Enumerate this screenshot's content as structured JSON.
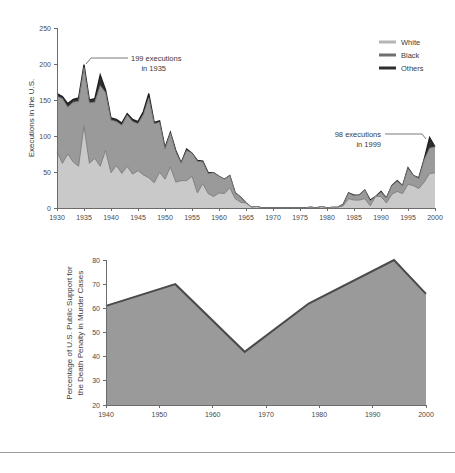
{
  "page": {
    "background": "#ffffff",
    "divider_color": "#9c9c9c"
  },
  "colors": {
    "white_band": "#c9c9c9",
    "black_band": "#9a9a9a",
    "others_band": "#2e2e2e",
    "support_fill": "#9a9a9a",
    "support_line": "#4a4a4a",
    "axis": "#6b6b6b",
    "text": "#3a3a3a"
  },
  "chart_data": [
    {
      "id": "executions",
      "type": "area",
      "stacked": true,
      "title": "",
      "xlabel": "",
      "ylabel": "Executions in the U.S.",
      "xlim": [
        1930,
        2000
      ],
      "ylim": [
        0,
        250
      ],
      "yticks": [
        0,
        50,
        100,
        150,
        200,
        250
      ],
      "ytick_labels": [
        "0",
        "50",
        "100",
        "150",
        "200",
        "250"
      ],
      "xticks": [
        1930,
        1935,
        1940,
        1945,
        1950,
        1955,
        1960,
        1965,
        1970,
        1975,
        1980,
        1985,
        1990,
        1995,
        2000
      ],
      "xtick_labels": [
        "1930",
        "1935",
        "1940",
        "1945",
        "1950",
        "1955",
        "1960",
        "1965",
        "1970",
        "1975",
        "1980",
        "1985",
        "1990",
        "1995",
        "2000"
      ],
      "grid": false,
      "legend_position": "top-right",
      "legend": [
        {
          "label": "White",
          "color": "#b5b5b5"
        },
        {
          "label": "Black",
          "color": "#6f6f6f"
        },
        {
          "label": "Others",
          "color": "#2e2e2e"
        }
      ],
      "x": [
        1930,
        1931,
        1932,
        1933,
        1934,
        1935,
        1936,
        1937,
        1938,
        1939,
        1940,
        1941,
        1942,
        1943,
        1944,
        1945,
        1946,
        1947,
        1948,
        1949,
        1950,
        1951,
        1952,
        1953,
        1954,
        1955,
        1956,
        1957,
        1958,
        1959,
        1960,
        1961,
        1962,
        1963,
        1964,
        1965,
        1966,
        1967,
        1968,
        1969,
        1970,
        1971,
        1972,
        1973,
        1974,
        1975,
        1976,
        1977,
        1978,
        1979,
        1980,
        1981,
        1982,
        1983,
        1984,
        1985,
        1986,
        1987,
        1988,
        1989,
        1990,
        1991,
        1992,
        1993,
        1994,
        1995,
        1996,
        1997,
        1998,
        1999,
        2000
      ],
      "series": [
        {
          "name": "White",
          "values": [
            78,
            62,
            75,
            64,
            58,
            114,
            62,
            69,
            58,
            80,
            49,
            59,
            48,
            58,
            47,
            52,
            46,
            42,
            35,
            50,
            40,
            57,
            36,
            38,
            38,
            44,
            21,
            34,
            20,
            16,
            21,
            20,
            28,
            13,
            8,
            7,
            1,
            2,
            0,
            0,
            0,
            0,
            0,
            0,
            0,
            0,
            0,
            1,
            0,
            2,
            0,
            1,
            1,
            3,
            13,
            11,
            11,
            13,
            3,
            16,
            16,
            7,
            19,
            23,
            20,
            33,
            31,
            27,
            36,
            48,
            49
          ],
          "color": "#c9c9c9"
        },
        {
          "name": "Black",
          "values": [
            77,
            90,
            65,
            83,
            90,
            81,
            84,
            78,
            112,
            80,
            73,
            61,
            67,
            71,
            73,
            65,
            84,
            111,
            82,
            69,
            42,
            47,
            42,
            24,
            42,
            32,
            44,
            30,
            28,
            33,
            23,
            20,
            17,
            8,
            7,
            0,
            0,
            0,
            0,
            0,
            0,
            0,
            0,
            0,
            0,
            0,
            0,
            0,
            0,
            0,
            0,
            0,
            0,
            2,
            8,
            6,
            7,
            12,
            7,
            0,
            6,
            7,
            12,
            14,
            11,
            22,
            14,
            14,
            31,
            35,
            36
          ],
          "color": "#9a9a9a"
        },
        {
          "name": "Others",
          "values": [
            4,
            3,
            5,
            4,
            5,
            4,
            4,
            5,
            15,
            4,
            3,
            3,
            3,
            2,
            3,
            3,
            4,
            6,
            2,
            2,
            2,
            1,
            2,
            1,
            2,
            0,
            1,
            1,
            1,
            0,
            0,
            0,
            0,
            0,
            0,
            0,
            0,
            0,
            0,
            0,
            0,
            0,
            0,
            0,
            0,
            0,
            0,
            0,
            0,
            0,
            0,
            0,
            0,
            0,
            0,
            1,
            0,
            0,
            1,
            0,
            1,
            0,
            0,
            1,
            0,
            1,
            0,
            1,
            1,
            15,
            0
          ],
          "color": "#2e2e2e"
        }
      ],
      "annotations": [
        {
          "id": "peak-1935",
          "line1": "199 executions",
          "line2": "in 1935",
          "x": 1935,
          "y": 199
        },
        {
          "id": "peak-1999",
          "line1": "98 executions",
          "line2": "in 1999",
          "x": 1999,
          "y": 98
        }
      ]
    },
    {
      "id": "support",
      "type": "area",
      "stacked": false,
      "title": "",
      "xlabel": "",
      "ylabel": "Percentage of  U.S. Public Support for\nthe Death Penalty in Murder Cases",
      "ylabel_line1": "Percentage of  U.S. Public Support for",
      "ylabel_line2": "the Death Penalty in Murder Cases",
      "xlim": [
        1940,
        2000
      ],
      "ylim": [
        20,
        80
      ],
      "yticks": [
        20,
        30,
        40,
        50,
        60,
        70,
        80
      ],
      "ytick_labels": [
        "20",
        "30",
        "40",
        "50",
        "60",
        "70",
        "80"
      ],
      "xticks": [
        1940,
        1950,
        1960,
        1970,
        1980,
        1990,
        2000
      ],
      "xtick_labels": [
        "1940",
        "1950",
        "1960",
        "1970",
        "1980",
        "1990",
        "2000"
      ],
      "grid": false,
      "x": [
        1940,
        1953,
        1966,
        1978,
        1994,
        2000
      ],
      "values": [
        61,
        70,
        42,
        62,
        80,
        66
      ],
      "fill_color": "#9a9a9a",
      "line_color": "#4a4a4a"
    }
  ]
}
